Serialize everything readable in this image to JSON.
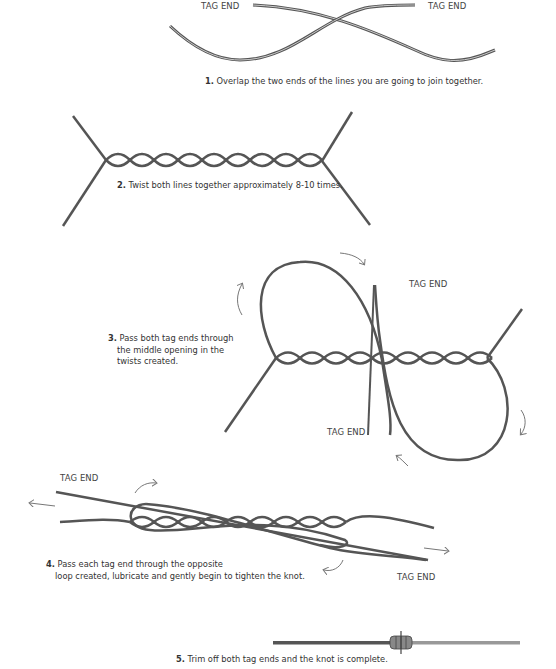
{
  "steps": [
    {
      "number": "1.",
      "text": "Overlap the two ends of the lines you are going to join together.",
      "labels": [
        "TAG END",
        "TAG END"
      ]
    },
    {
      "number": "2.",
      "text": "Twist both lines together approximately 8-10 times.",
      "labels": []
    },
    {
      "number": "3.",
      "text_lines": [
        "Pass both tag ends through",
        "the middle opening in the",
        "twists created."
      ],
      "labels": [
        "TAG END",
        "TAG END"
      ]
    },
    {
      "number": "4.",
      "text_lines": [
        "Pass each tag end through the opposite",
        "loop created, lubricate and gently begin to tighten the knot."
      ],
      "labels": [
        "TAG END",
        "TAG END"
      ]
    },
    {
      "number": "5.",
      "text": "Trim off both tag ends and the knot is complete.",
      "labels": []
    }
  ],
  "colors": {
    "line": "#5a5a5a",
    "line_highlight": "#bdbdbd",
    "arrow": "#777777",
    "text": "#333333"
  }
}
